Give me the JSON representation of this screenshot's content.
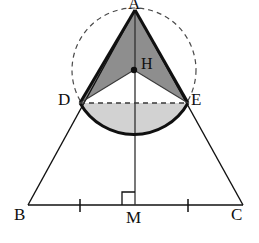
{
  "figure": {
    "background_color": "#ffffff",
    "stroke_color": "#101010",
    "fill_dark": "#8e8e8e",
    "fill_light": "#d2d2d2",
    "dash_color": "#4a4a4a"
  },
  "labels": [
    {
      "id": "A",
      "text": "A",
      "x": 128,
      "y": -4,
      "role": "apex-vertex"
    },
    {
      "id": "B",
      "text": "B",
      "x": 14,
      "y": 207,
      "role": "base-vertex-left"
    },
    {
      "id": "C",
      "text": "C",
      "x": 231,
      "y": 207,
      "role": "base-vertex-right"
    },
    {
      "id": "M",
      "text": "M",
      "x": 126,
      "y": 210,
      "role": "base-midpoint"
    },
    {
      "id": "D",
      "text": "D",
      "x": 58,
      "y": 92,
      "role": "circle-point-left"
    },
    {
      "id": "E",
      "text": "E",
      "x": 191,
      "y": 92,
      "role": "circle-point-right"
    },
    {
      "id": "H",
      "text": "H",
      "x": 141,
      "y": 56,
      "role": "circle-center"
    }
  ],
  "points": {
    "A": {
      "x": 135,
      "y": 10
    },
    "B": {
      "x": 28,
      "y": 205
    },
    "C": {
      "x": 243,
      "y": 205
    },
    "M": {
      "x": 135,
      "y": 205
    },
    "D": {
      "x": 80,
      "y": 103
    },
    "E": {
      "x": 188,
      "y": 103
    },
    "H": {
      "x": 134,
      "y": 70
    },
    "arc_bottom": {
      "x": 134,
      "y": 139
    }
  },
  "circle": {
    "center_x": 134,
    "center_y": 70,
    "radius": 62,
    "style": "dashed",
    "note": "circumscribed circle through A, D and E"
  },
  "segments": [
    {
      "name": "side-AB",
      "from": "A",
      "to": "B",
      "style": "solid"
    },
    {
      "name": "side-AC",
      "from": "A",
      "to": "C",
      "style": "solid"
    },
    {
      "name": "base-BC",
      "from": "B",
      "to": "C",
      "style": "solid"
    },
    {
      "name": "altitude-AM",
      "from": "A",
      "to": "M",
      "style": "solid"
    },
    {
      "name": "chord-DE",
      "from": "D",
      "to": "E",
      "style": "dashed"
    },
    {
      "name": "radius-HD",
      "from": "H",
      "to": "D",
      "style": "solid"
    },
    {
      "name": "radius-HE",
      "from": "H",
      "to": "E",
      "style": "solid"
    }
  ],
  "regions": [
    {
      "name": "upper-cone-region",
      "fill": "#8e8e8e",
      "vertices": "A-D-H-E",
      "shade": "dark gray"
    },
    {
      "name": "lower-segment-region",
      "fill": "#d2d2d2",
      "vertices": "D-arc-E",
      "shade": "light gray"
    }
  ],
  "marks": {
    "right_angle": {
      "name": "right-angle-at-M",
      "x": 123,
      "y": 192,
      "size": 13,
      "side": "left-of-altitude"
    },
    "tick_BM": {
      "name": "congruence-tick-BM",
      "x": 80,
      "y": 205
    },
    "tick_MC": {
      "name": "congruence-tick-MC",
      "x": 188,
      "y": 205
    },
    "center_dot": {
      "name": "center-point-dot-H",
      "x": 134,
      "y": 70,
      "r": 3.2
    }
  }
}
